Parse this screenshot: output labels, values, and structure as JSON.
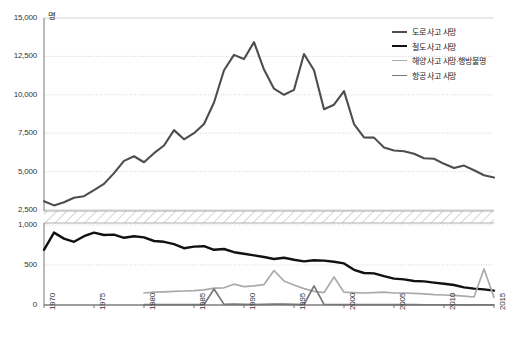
{
  "chart_data": {
    "type": "line",
    "title": "",
    "subtitle": "",
    "xlabel": "",
    "ylabel": "",
    "unit_label": "명",
    "grid": true,
    "legend_position": "top-right",
    "broken_axis": {
      "enabled": true,
      "lower_panel_range": [
        0,
        1000
      ],
      "upper_panel_range": [
        2500,
        15000
      ],
      "break_hatched": true
    },
    "x": [
      1970,
      1971,
      1972,
      1973,
      1974,
      1975,
      1976,
      1977,
      1978,
      1979,
      1980,
      1981,
      1982,
      1983,
      1984,
      1985,
      1986,
      1987,
      1988,
      1989,
      1990,
      1991,
      1992,
      1993,
      1994,
      1995,
      1996,
      1997,
      1998,
      1999,
      2000,
      2001,
      2002,
      2003,
      2004,
      2005,
      2006,
      2007,
      2008,
      2009,
      2010,
      2011,
      2012,
      2013,
      2014,
      2015
    ],
    "xlim": [
      1970,
      2015
    ],
    "xticks": [
      1970,
      1975,
      1980,
      1985,
      1990,
      1995,
      2000,
      2005,
      2010,
      2015
    ],
    "xtick_labels": [
      "1970",
      "1975",
      "1980",
      "1985",
      "1990",
      "1995",
      "2000",
      "2005",
      "2010",
      "2015"
    ],
    "upper_yticks": [
      2500,
      5000,
      7500,
      10000,
      12500,
      15000
    ],
    "upper_ytick_labels": [
      "2,500",
      "5,000",
      "7,500",
      "10,000",
      "12,500",
      "15,000"
    ],
    "lower_yticks": [
      0,
      500,
      1000
    ],
    "lower_ytick_labels": [
      "0",
      "500",
      "1,000"
    ],
    "series": [
      {
        "name": "도로 사고 사망",
        "color": "#4d4d4d",
        "width": 2.1,
        "panel": "upper",
        "values": [
          3069,
          2800,
          3000,
          3300,
          3400,
          3800,
          4200,
          4900,
          5700,
          6000,
          5608,
          6200,
          6700,
          7700,
          7100,
          7500,
          8100,
          9500,
          11600,
          12600,
          12325,
          13429,
          11640,
          10400,
          10000,
          10323,
          12653,
          11603,
          9057,
          9353,
          10236,
          8097,
          7222,
          7212,
          6563,
          6376,
          6327,
          6166,
          5870,
          5838,
          5505,
          5229,
          5392,
          5092,
          4762,
          4621
        ]
      },
      {
        "name": "철도 사고 사망",
        "color": "#111111",
        "width": 2.4,
        "panel": "lower",
        "values": [
          690,
          905,
          830,
          790,
          860,
          905,
          875,
          880,
          840,
          860,
          845,
          800,
          790,
          760,
          710,
          730,
          735,
          690,
          700,
          660,
          640,
          620,
          600,
          575,
          590,
          565,
          545,
          560,
          555,
          540,
          520,
          440,
          400,
          395,
          360,
          330,
          320,
          300,
          295,
          280,
          265,
          250,
          220,
          205,
          195,
          180
        ]
      },
      {
        "name": "해양 사고 사망·행방불명",
        "color": "#aaaaaa",
        "width": 1.7,
        "panel": "lower",
        "values": [
          null,
          null,
          null,
          null,
          null,
          null,
          null,
          null,
          null,
          null,
          150,
          160,
          165,
          170,
          175,
          180,
          190,
          210,
          215,
          260,
          230,
          240,
          255,
          430,
          300,
          250,
          205,
          170,
          155,
          350,
          160,
          155,
          150,
          155,
          160,
          150,
          150,
          145,
          140,
          130,
          125,
          120,
          110,
          100,
          450,
          95
        ]
      },
      {
        "name": "항공 사고 사망",
        "color": "#777777",
        "width": 1.7,
        "panel": "lower",
        "values": [
          null,
          null,
          null,
          null,
          null,
          null,
          null,
          null,
          null,
          null,
          5,
          6,
          4,
          5,
          4,
          6,
          5,
          200,
          8,
          10,
          7,
          6,
          8,
          12,
          10,
          8,
          6,
          240,
          7,
          6,
          5,
          6,
          5,
          4,
          5,
          5,
          4,
          4,
          3,
          3,
          3,
          3,
          2,
          2,
          3,
          2
        ]
      }
    ]
  },
  "legend": {
    "items": [
      {
        "label": "도로 사고 사망",
        "color": "#4d4d4d"
      },
      {
        "label": "철도 사고 사망",
        "color": "#111111"
      },
      {
        "label": "해양 사고 사망·행방불명",
        "color": "#aaaaaa"
      },
      {
        "label": "항공 사고 사망",
        "color": "#777777"
      }
    ]
  }
}
